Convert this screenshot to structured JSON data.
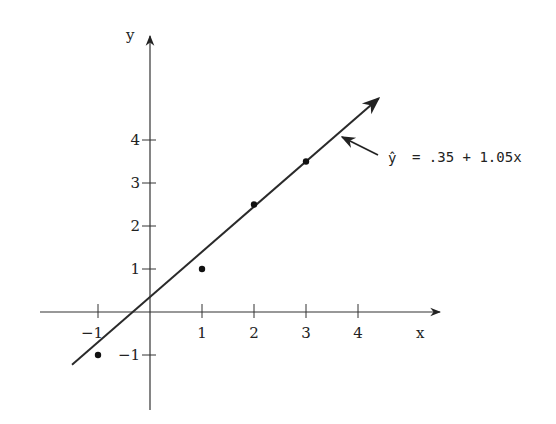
{
  "chart_data": {
    "type": "scatter",
    "title": "",
    "xlabel": "x",
    "ylabel": "y",
    "xlim": [
      -2,
      5.5
    ],
    "ylim": [
      -2.3,
      5.8
    ],
    "grid": false,
    "x_ticks": [
      -1,
      1,
      2,
      3,
      4
    ],
    "x_tick_labels": [
      "-1",
      "1",
      "2",
      "3",
      "4"
    ],
    "y_ticks": [
      -1,
      1,
      2,
      3,
      4
    ],
    "y_tick_labels": [
      "-1",
      "1",
      "2",
      "3",
      "4"
    ],
    "series": [
      {
        "name": "observations",
        "type": "scatter",
        "x": [
          -1,
          1,
          2,
          3
        ],
        "y": [
          -1,
          1,
          2.5,
          3.5
        ]
      },
      {
        "name": "fitted line",
        "type": "line",
        "intercept": 0.35,
        "slope": 1.05,
        "x_range": [
          -1.5,
          4.4
        ]
      }
    ],
    "annotations": [
      {
        "text_hat": "ŷ",
        "text": " = .35 + 1.05x",
        "points_to": [
          3.8,
          4.34
        ]
      }
    ]
  },
  "axes": {
    "x_label": "x",
    "y_label": "y"
  },
  "annotation": {
    "yhat": "ŷ",
    "equation": "= .35 + 1.05x"
  }
}
